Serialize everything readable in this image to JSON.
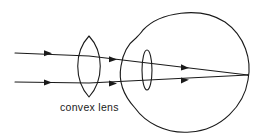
{
  "diagram": {
    "labels": {
      "convex_lens": "convex lens"
    },
    "components": [
      {
        "id": "convex-lens",
        "kind": "converging lens, external"
      },
      {
        "id": "eyeball",
        "kind": "eye outline with corneal bulge"
      },
      {
        "id": "eye-lens",
        "kind": "crystalline lens inside eye"
      },
      {
        "id": "light-ray-upper",
        "kind": "parallel incoming ray, 3 arrows"
      },
      {
        "id": "light-ray-lower",
        "kind": "parallel incoming ray, 3 arrows"
      },
      {
        "id": "focal-point",
        "kind": "rays converge on retina"
      }
    ],
    "colors": {
      "line": "#1a1a1a",
      "background": "#ffffff"
    }
  }
}
